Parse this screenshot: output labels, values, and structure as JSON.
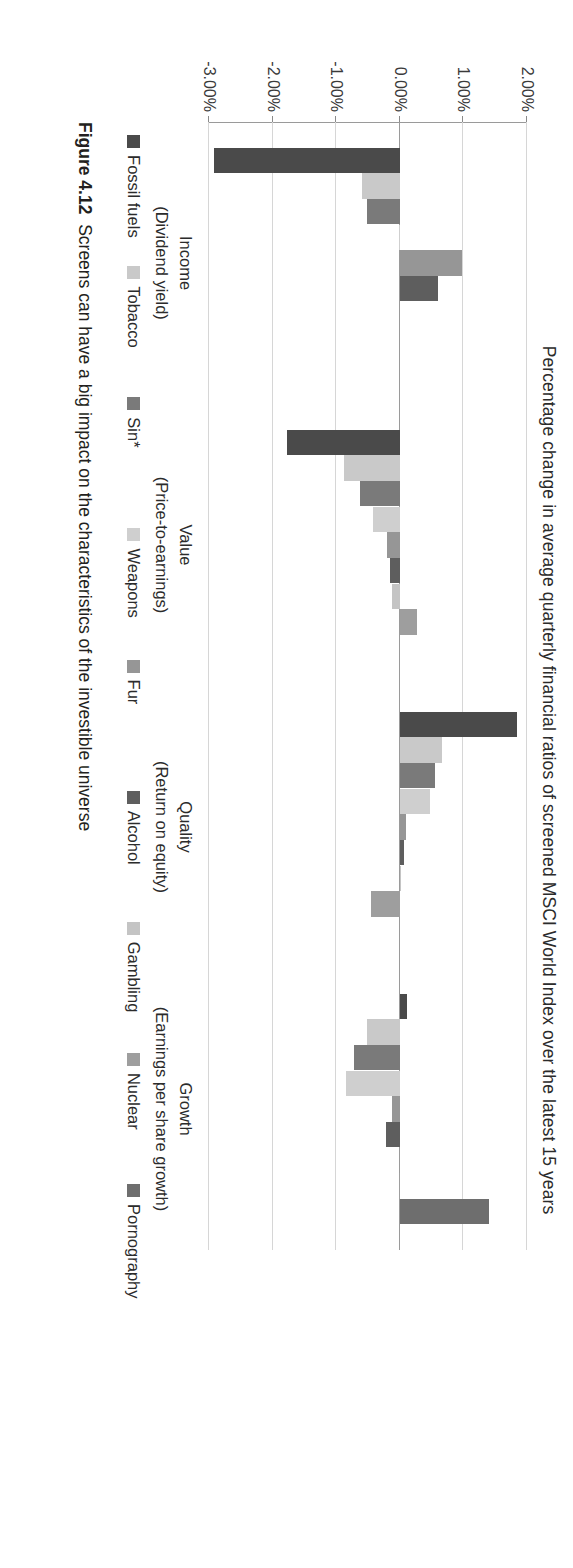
{
  "chart_data": {
    "type": "bar",
    "orientation": "vertical",
    "title": "Percentage change in average quarterly financial ratios of screened MSCI World Index over the latest 15 years",
    "xlabel": "",
    "ylabel": "",
    "ylim": [
      -3.0,
      2.0
    ],
    "ytick_labels": [
      "2.00%",
      "1.00%",
      "0.00%",
      "-1.00%",
      "-2.00%",
      "-3.00%"
    ],
    "ytick_values": [
      2.0,
      1.0,
      0.0,
      -1.0,
      -2.0,
      -3.0
    ],
    "grid": true,
    "legend_position": "bottom",
    "categories": [
      "Income",
      "Value",
      "Quality",
      "Growth"
    ],
    "category_sublabels": [
      "(Dividend yield)",
      "(Price-to-earnings)",
      "(Return on equity)",
      "(Earnings per share growth)"
    ],
    "series": [
      {
        "name": "Fossil fuels",
        "color": "#4a4a4a",
        "values": [
          -2.92,
          -1.78,
          1.85,
          0.11
        ]
      },
      {
        "name": "Tobacco",
        "color": "#c9c9c9",
        "values": [
          -0.6,
          -0.88,
          0.66,
          -0.52
        ]
      },
      {
        "name": "Sin*",
        "color": "#7a7a7a",
        "values": [
          -0.52,
          -0.62,
          0.55,
          -0.72
        ]
      },
      {
        "name": "Weapons",
        "color": "#cfcfcf",
        "values": [
          -0.02,
          -0.42,
          0.48,
          -0.84
        ]
      },
      {
        "name": "Fur",
        "color": "#969696",
        "values": [
          0.98,
          -0.2,
          0.09,
          -0.13
        ]
      },
      {
        "name": "Alcohol",
        "color": "#5e5e5e",
        "values": [
          0.6,
          -0.16,
          0.07,
          -0.21
        ]
      },
      {
        "name": "Gambling",
        "color": "#c4c4c4",
        "values": [
          0.01,
          -0.13,
          0.02,
          0.0
        ]
      },
      {
        "name": "Nuclear",
        "color": "#9e9e9e",
        "values": [
          0.0,
          0.27,
          -0.46,
          -0.02
        ]
      },
      {
        "name": "Pornography",
        "color": "#6e6e6e",
        "values": [
          0.0,
          0.0,
          0.0,
          1.4
        ]
      }
    ]
  },
  "legend": {
    "items": [
      {
        "label": "Fossil fuels",
        "color": "#4a4a4a"
      },
      {
        "label": "Tobacco",
        "color": "#c9c9c9"
      },
      {
        "label": "Sin*",
        "color": "#7a7a7a"
      },
      {
        "label": "Weapons",
        "color": "#cfcfcf"
      },
      {
        "label": "Fur",
        "color": "#969696"
      },
      {
        "label": "Alcohol",
        "color": "#5e5e5e"
      },
      {
        "label": "Gambling",
        "color": "#c4c4c4"
      },
      {
        "label": "Nuclear",
        "color": "#9e9e9e"
      },
      {
        "label": "Pornography",
        "color": "#6e6e6e"
      }
    ]
  },
  "caption": {
    "number": "Figure 4.12",
    "text": "Screens can have a big impact on the characteristics of the investible universe"
  }
}
